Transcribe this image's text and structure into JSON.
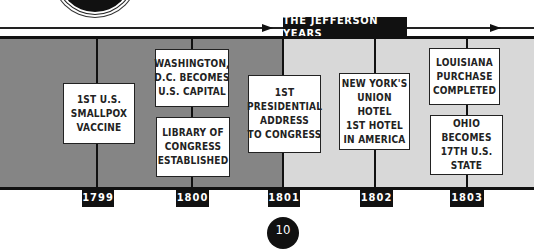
{
  "header": {
    "era_label": "THE JEFFERSON YEARS"
  },
  "timeline": {
    "years": [
      "1799",
      "1800",
      "1801",
      "1802",
      "1803"
    ],
    "events": [
      {
        "year": "1799",
        "text": "1ST U.S.\nSMALLPOX\nVACCINE"
      },
      {
        "year": "1800",
        "text": "WASHINGTON,\nD.C. BECOMES\nU.S. CAPITAL"
      },
      {
        "year": "1800",
        "text": "LIBRARY OF\nCONGRESS\nESTABLISHED"
      },
      {
        "year": "1801",
        "text": "1ST\nPRESIDENTIAL\nADDRESS\nTO CONGRESS"
      },
      {
        "year": "1802",
        "text": "NEW YORK'S\nUNION HOTEL\n1ST HOTEL\nIN AMERICA"
      },
      {
        "year": "1803",
        "text": "LOUISIANA\nPURCHASE\nCOMPLETED"
      },
      {
        "year": "1803",
        "text": "OHIO\nBECOMES\n17TH U.S. STATE"
      }
    ]
  },
  "footer": {
    "page_number": "10"
  },
  "colors": {
    "pre_jefferson_band": "#858585",
    "jefferson_band": "#d8d8d8",
    "label_bg": "#111111"
  }
}
